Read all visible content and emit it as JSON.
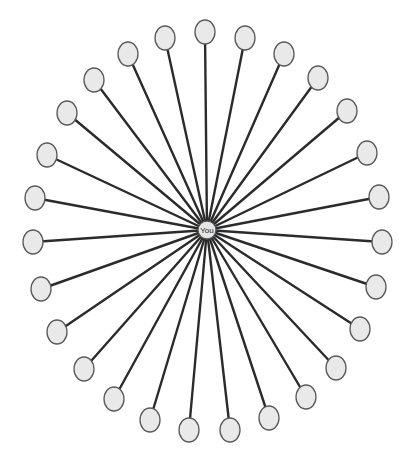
{
  "diagram": {
    "type": "star-network",
    "background": "#ffffff",
    "edge_color": "#2b2b2b",
    "node_fill": "#e9e9e9",
    "node_stroke": "#5a5a5a",
    "center": {
      "label": "You",
      "x": 207,
      "y": 230,
      "rx": 9,
      "ry": 9
    },
    "leaf_rx": 10,
    "leaf_ry": 12,
    "leaves": [
      {
        "x": 205,
        "y": 32
      },
      {
        "x": 245,
        "y": 38
      },
      {
        "x": 284,
        "y": 54
      },
      {
        "x": 318,
        "y": 78
      },
      {
        "x": 347,
        "y": 111
      },
      {
        "x": 367,
        "y": 153
      },
      {
        "x": 379,
        "y": 197
      },
      {
        "x": 382,
        "y": 242
      },
      {
        "x": 376,
        "y": 287
      },
      {
        "x": 360,
        "y": 329
      },
      {
        "x": 336,
        "y": 368
      },
      {
        "x": 306,
        "y": 397
      },
      {
        "x": 269,
        "y": 418
      },
      {
        "x": 230,
        "y": 430
      },
      {
        "x": 189,
        "y": 430
      },
      {
        "x": 150,
        "y": 420
      },
      {
        "x": 114,
        "y": 399
      },
      {
        "x": 84,
        "y": 369
      },
      {
        "x": 57,
        "y": 332
      },
      {
        "x": 41,
        "y": 289
      },
      {
        "x": 33,
        "y": 242
      },
      {
        "x": 35,
        "y": 198
      },
      {
        "x": 47,
        "y": 155
      },
      {
        "x": 67,
        "y": 113
      },
      {
        "x": 94,
        "y": 80
      },
      {
        "x": 128,
        "y": 54
      },
      {
        "x": 165,
        "y": 38
      }
    ]
  }
}
